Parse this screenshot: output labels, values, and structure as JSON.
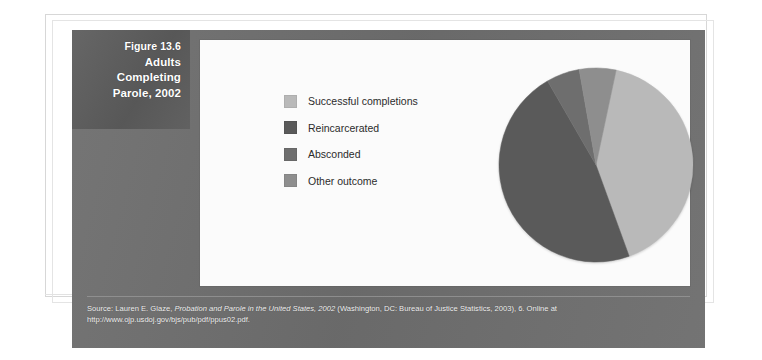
{
  "figure": {
    "number_label": "Figure 13.6",
    "title_line_1": "Adults",
    "title_line_2": "Completing",
    "title_line_3": "Parole, 2002"
  },
  "legend": {
    "items": [
      {
        "label": "Successful completions",
        "color": "#b9b9b9"
      },
      {
        "label": "Reincarcerated",
        "color": "#5a5a5a"
      },
      {
        "label": "Absconded",
        "color": "#6e6e6e"
      },
      {
        "label": "Other outcome",
        "color": "#8e8e8e"
      }
    ]
  },
  "source": {
    "line_1_prefix": "Source: Lauren E. Glaze, ",
    "line_1_italic": "Probation and Parole in the United States, 2002",
    "line_1_suffix": " (Washington, DC: Bureau of Justice Statistics, 2003), 6. Online at",
    "line_2": "http://www.ojp.usdoj.gov/bjs/pub/pdf/ppus02.pdf."
  },
  "chart_data": {
    "type": "pie",
    "title": "Adults Completing Parole, 2002",
    "xlabel": "",
    "ylabel": "",
    "grid": false,
    "legend_position": "left",
    "start_angle_deg": 12,
    "direction": "clockwise",
    "categories": [
      "Successful completions",
      "Reincarcerated",
      "Absconded",
      "Other outcome"
    ],
    "values": [
      41,
      47,
      6,
      6
    ],
    "units": "percent",
    "colors": [
      "#b9b9b9",
      "#5a5a5a",
      "#6e6e6e",
      "#8e8e8e"
    ],
    "slices": [
      {
        "label": "Successful completions",
        "value": 41,
        "color": "#b9b9b9",
        "start_deg": 12,
        "end_deg": 160
      },
      {
        "label": "Reincarcerated",
        "value": 47,
        "color": "#5a5a5a",
        "start_deg": 160,
        "end_deg": 330
      },
      {
        "label": "Absconded",
        "value": 6,
        "color": "#6e6e6e",
        "start_deg": 330,
        "end_deg": 350
      },
      {
        "label": "Other outcome",
        "value": 6,
        "color": "#8e8e8e",
        "start_deg": 350,
        "end_deg": 372
      }
    ]
  }
}
